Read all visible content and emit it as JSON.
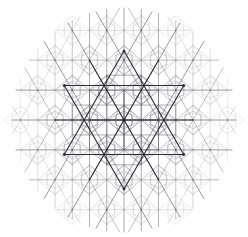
{
  "figure": {
    "type": "line-art-geometric-pattern",
    "width": 248,
    "height": 237,
    "background_color": "#ffffff"
  },
  "canvas": {
    "center_x": 124,
    "center_y": 120,
    "pattern_radius": 112
  },
  "lattice": {
    "description": "Triangular / hexagonal lattice of construction lines",
    "column_spacing": 34.5,
    "row_spacing": 29.9,
    "rows": 8,
    "columns": 8,
    "line_color": "#555560",
    "vertex_color": "#4a4a55",
    "vertex_radius": 0.9
  },
  "motifs": {
    "rhombus": {
      "name": "rhombus-cell",
      "color": "#5a5a66",
      "stroke_width": 0.6
    },
    "lens": {
      "name": "vesica-lens",
      "color": "#8a8a96",
      "stroke_width": 0.55,
      "count_per_cell": 2
    },
    "inner_lens": {
      "name": "inner-vesica-lens",
      "color": "#a6a6b2",
      "stroke_width": 0.5
    },
    "hex_ring": {
      "name": "hexagon-ring",
      "color": "#70707c",
      "stroke_width": 0.55
    },
    "square_frame": {
      "name": "square-frame",
      "color": "#5f5f6b",
      "stroke_width": 0.6
    }
  },
  "central_star": {
    "name": "central-hexagram",
    "color": "#1f1f28",
    "stroke_width": 1.15,
    "points": 6,
    "outer_radius": 69,
    "rotation_deg": 0
  },
  "central_axes": {
    "name": "central-axis-lines",
    "color": "#1f1f28",
    "stroke_width": 1.1,
    "count": 3
  },
  "fade": {
    "description": "Opacity falls off radially from the centre",
    "center_opacity": 1.0,
    "edge_opacity": 0.06,
    "falloff_start_radius": 28,
    "falloff_end_radius": 120
  },
  "chart_data": {
    "type": "scatter",
    "xlabel": "",
    "ylabel": "",
    "xlim": [
      0,
      248
    ],
    "ylim": [
      0,
      237
    ],
    "grid": false,
    "legend_position": "none",
    "categories": [
      "lattice-lines",
      "rhombus-cells",
      "vesica-lenses",
      "hexagon-rings",
      "square-frames",
      "central-hexagram"
    ],
    "values": [
      96,
      84,
      168,
      24,
      12,
      1
    ],
    "annotations": []
  }
}
